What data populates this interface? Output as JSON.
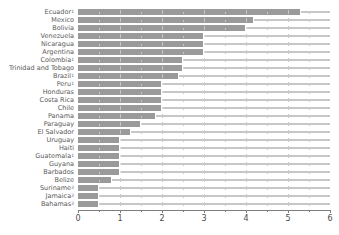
{
  "chart_data": {
    "type": "bar",
    "orientation": "horizontal",
    "title": "",
    "xlabel": "",
    "ylabel": "",
    "xlim": [
      0,
      6
    ],
    "xticks": [
      0,
      1,
      2,
      3,
      4,
      5,
      6
    ],
    "xtick_labels": [
      "0",
      "1",
      "2",
      "3",
      "4",
      "5",
      "6"
    ],
    "minor_tick_step": 0.5,
    "grid": true,
    "legend": null,
    "bar_color": "#9a9a9a",
    "categories": [
      "Ecuador",
      "Mexico",
      "Bolivia",
      "Venezuela",
      "Nicaragua",
      "Argentina",
      "Colombia",
      "Trinidad and Tobago",
      "Brazil",
      "Peru",
      "Honduras",
      "Costa Rica",
      "Chile",
      "Panama",
      "Paraguay",
      "El Salvador",
      "Uruguay",
      "Haiti",
      "Guatemala",
      "Guyana",
      "Barbados",
      "Belize",
      "Suriname",
      "Jamaica",
      "Bahamas"
    ],
    "category_footnotes": [
      "1",
      "",
      "",
      "",
      "",
      "",
      "1",
      "",
      "1",
      "1",
      "",
      "",
      "",
      "",
      "",
      "",
      "",
      "",
      "1",
      "",
      "",
      "",
      "2",
      "2",
      "2"
    ],
    "values": [
      5.3,
      4.2,
      4.0,
      3.0,
      3.0,
      3.0,
      2.5,
      2.5,
      2.4,
      2.0,
      2.0,
      2.0,
      2.0,
      1.85,
      1.5,
      1.25,
      1.0,
      1.0,
      1.0,
      1.0,
      1.0,
      0.8,
      0.5,
      0.5,
      0.5
    ]
  }
}
